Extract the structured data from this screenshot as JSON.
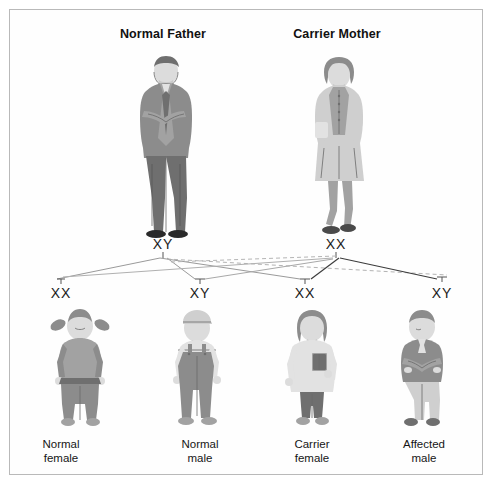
{
  "diagram": {
    "title_father": "Normal Father",
    "title_mother": "Carrier Mother",
    "parents": [
      {
        "label": "Normal Father",
        "genotype": "XY",
        "figure": "adult-man-suit-arms-crossed"
      },
      {
        "label": "Carrier Mother",
        "genotype": "XX",
        "figure": "adult-woman-skirt-suit"
      }
    ],
    "offspring": [
      {
        "genotype": "XX",
        "caption_line1": "Normal",
        "caption_line2": "female",
        "figure": "girl-pigtails"
      },
      {
        "genotype": "XY",
        "caption_line1": "Normal",
        "caption_line2": "male",
        "figure": "boy-overalls-cap"
      },
      {
        "genotype": "XX",
        "caption_line1": "Carrier",
        "caption_line2": "female",
        "figure": "girl-holding-book"
      },
      {
        "genotype": "XY",
        "caption_line1": "Affected",
        "caption_line2": "male",
        "figure": "boy-arms-crossed"
      }
    ],
    "colors": {
      "border": "#b9b9b9",
      "background": "#ffffff",
      "text": "#111111",
      "line_dark": "#3c3c3c",
      "line_light": "#b0b0b0"
    }
  }
}
